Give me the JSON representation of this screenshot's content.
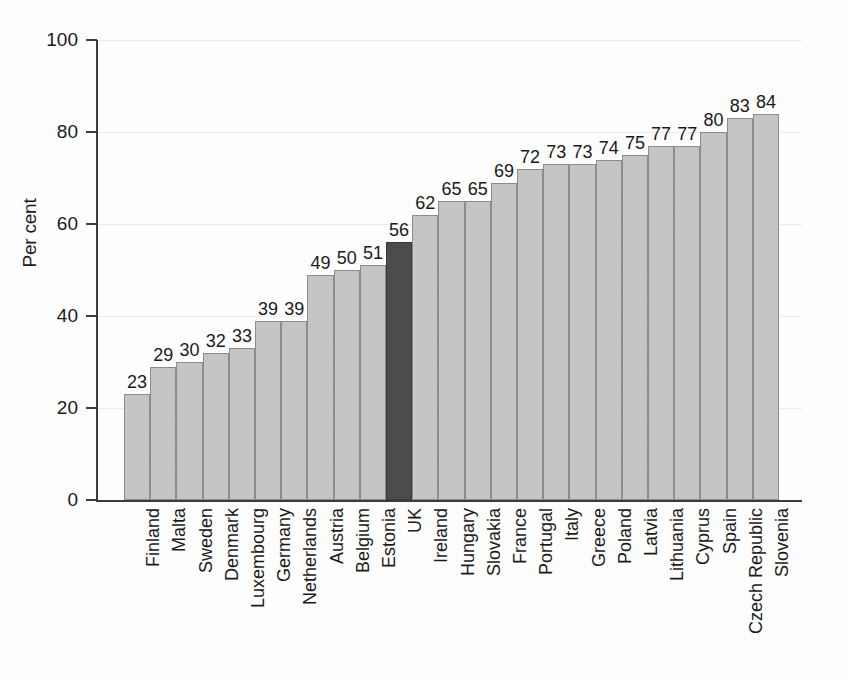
{
  "chart_data": {
    "type": "bar",
    "title": "",
    "xlabel": "",
    "ylabel": "Per cent",
    "ylim": [
      0,
      100
    ],
    "yticks": [
      0,
      20,
      40,
      60,
      80,
      100
    ],
    "ytick_labels": [
      "0",
      "20",
      "40",
      "60",
      "80",
      "100"
    ],
    "grid": true,
    "legend": false,
    "highlight_category": "UK",
    "colors": {
      "bar": "#c6c6c6",
      "bar_border": "#8d8d8d",
      "highlight_bar": "#4c4c4c",
      "highlight_border": "#3a3a3a",
      "axis": "#3c3c3c",
      "gridline": "#ededed",
      "text": "#1a1a1a",
      "background": "#ffffff"
    },
    "categories": [
      "Finland",
      "Malta",
      "Sweden",
      "Denmark",
      "Luxembourg",
      "Germany",
      "Netherlands",
      "Austria",
      "Belgium",
      "Estonia",
      "UK",
      "Ireland",
      "Hungary",
      "Slovakia",
      "France",
      "Portugal",
      "Italy",
      "Greece",
      "Poland",
      "Latvia",
      "Lithuania",
      "Cyprus",
      "Spain",
      "Czech Republic",
      "Slovenia"
    ],
    "values": [
      23,
      29,
      30,
      32,
      33,
      39,
      39,
      49,
      50,
      51,
      56,
      62,
      65,
      65,
      69,
      72,
      73,
      73,
      74,
      75,
      77,
      77,
      80,
      83,
      84
    ],
    "data_labels": [
      "23",
      "29",
      "30",
      "32",
      "33",
      "39",
      "39",
      "49",
      "50",
      "51",
      "56",
      "62",
      "65",
      "65",
      "69",
      "72",
      "73",
      "73",
      "74",
      "75",
      "77",
      "77",
      "80",
      "83",
      "84"
    ]
  }
}
